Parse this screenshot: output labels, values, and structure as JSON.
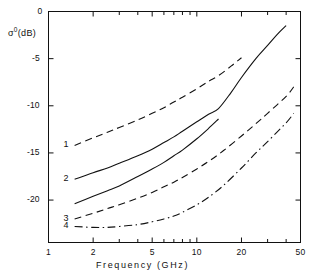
{
  "chart_data": {
    "type": "line",
    "title": "",
    "xlabel": "Frequency  (GHz)",
    "ylabel": "σ⁰(dB)",
    "xscale": "log",
    "xlim": [
      1,
      50
    ],
    "ylim": [
      -24.5,
      0
    ],
    "grid": false,
    "legend": "inline-curve-numbers",
    "xticks": [
      1,
      2,
      5,
      10,
      20,
      50
    ],
    "xtick_labels": [
      "1",
      "2",
      "5",
      "10",
      "20",
      "50"
    ],
    "yticks": [
      0,
      -5,
      -10,
      -15,
      -20
    ],
    "ytick_labels": [
      "0",
      "-5",
      "-10",
      "-15",
      "-20"
    ],
    "series": [
      {
        "name": "1",
        "label": "1",
        "style": "dashed",
        "color": "#111111",
        "x": [
          1.5,
          2,
          2.5,
          3,
          4,
          5,
          6,
          7,
          8,
          10,
          12,
          14,
          17,
          20
        ],
        "y": [
          -14.2,
          -13.4,
          -12.8,
          -12.3,
          -11.5,
          -10.8,
          -10.2,
          -9.6,
          -9.1,
          -8.2,
          -7.4,
          -6.8,
          -5.8,
          -4.9
        ]
      },
      {
        "name": "2",
        "label": "2",
        "style": "solid",
        "color": "#111111",
        "x": [
          1.5,
          2,
          2.5,
          3,
          4,
          5,
          6,
          7,
          8,
          10,
          12,
          14,
          17,
          20,
          25,
          30,
          35,
          40
        ],
        "y": [
          -17.8,
          -17.1,
          -16.6,
          -16.1,
          -15.3,
          -14.6,
          -13.9,
          -13.3,
          -12.7,
          -11.7,
          -10.9,
          -10.3,
          -8.6,
          -7.0,
          -5.0,
          -3.6,
          -2.4,
          -1.5
        ]
      },
      {
        "name": "3-solid",
        "label": "",
        "style": "solid",
        "color": "#111111",
        "x": [
          1.5,
          2,
          2.5,
          3,
          4,
          5,
          6,
          7,
          8,
          10,
          12,
          14
        ],
        "y": [
          -20.4,
          -19.6,
          -19.0,
          -18.5,
          -17.5,
          -16.7,
          -16.0,
          -15.3,
          -14.7,
          -13.5,
          -12.4,
          -11.4
        ]
      },
      {
        "name": "3",
        "label": "3",
        "style": "dashed",
        "color": "#111111",
        "x": [
          1.5,
          2,
          2.5,
          3,
          4,
          5,
          6,
          7,
          8,
          10,
          12,
          15,
          20,
          25,
          30,
          40,
          45
        ],
        "y": [
          -22.0,
          -21.4,
          -20.9,
          -20.5,
          -19.8,
          -19.2,
          -18.6,
          -18.1,
          -17.6,
          -16.7,
          -15.9,
          -14.8,
          -13.2,
          -11.9,
          -10.8,
          -9.0,
          -8.0
        ]
      },
      {
        "name": "4",
        "label": "4",
        "style": "dash-dot",
        "color": "#111111",
        "x": [
          1.5,
          2,
          2.5,
          3,
          4,
          5,
          6,
          7,
          8,
          10,
          12,
          15,
          20,
          25,
          30,
          40,
          45
        ],
        "y": [
          -22.8,
          -22.9,
          -22.9,
          -22.8,
          -22.6,
          -22.3,
          -22.0,
          -21.7,
          -21.3,
          -20.5,
          -19.7,
          -18.5,
          -16.6,
          -15.0,
          -13.8,
          -11.8,
          -10.8
        ]
      }
    ]
  },
  "axis": {
    "ylabel_sigma": "σ",
    "ylabel_sup": "0",
    "ylabel_unit": "(dB)",
    "xtitle": "Frequency   (GHz)"
  },
  "curve_labels": [
    {
      "text": "1"
    },
    {
      "text": "2"
    },
    {
      "text": "3"
    },
    {
      "text": "4"
    }
  ]
}
